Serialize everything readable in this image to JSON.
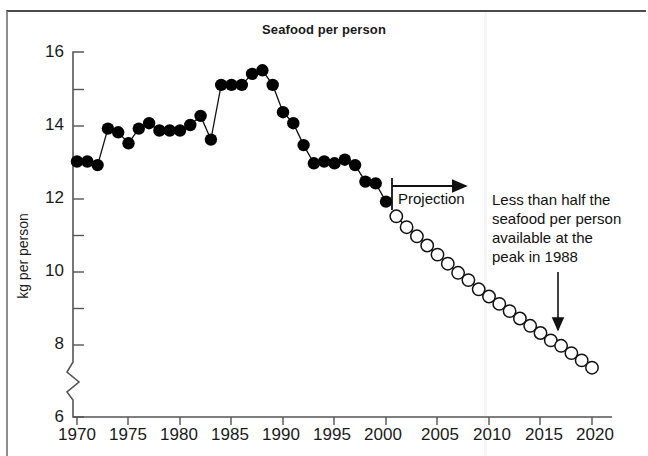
{
  "chart_data": {
    "type": "line",
    "title": "Seafood per person",
    "xlabel": "",
    "ylabel": "kg per person",
    "xlim": [
      1969,
      2021
    ],
    "ylim": [
      6,
      16
    ],
    "yaxis_break": true,
    "grid": false,
    "legend": null,
    "xticks": [
      "1970",
      "1975",
      "1980",
      "1985",
      "1990",
      "1995",
      "2000",
      "2005",
      "2010",
      "2015",
      "2020"
    ],
    "yticks": [
      "6",
      "8",
      "10",
      "12",
      "14",
      "16"
    ],
    "yminorticks": [
      7,
      9,
      11,
      13,
      15
    ],
    "series": [
      {
        "name": "Historical",
        "marker": "filled-circle",
        "color": "#000000",
        "x": [
          1970,
          1971,
          1972,
          1973,
          1974,
          1975,
          1976,
          1977,
          1978,
          1979,
          1980,
          1981,
          1982,
          1983,
          1984,
          1985,
          1986,
          1987,
          1988,
          1989,
          1990,
          1991,
          1992,
          1993,
          1994,
          1995,
          1996,
          1997,
          1998,
          1999,
          2000
        ],
        "values": [
          13.0,
          13.0,
          12.9,
          13.9,
          13.8,
          13.5,
          13.9,
          14.05,
          13.85,
          13.85,
          13.85,
          14.0,
          14.25,
          13.6,
          15.1,
          15.1,
          15.1,
          15.4,
          15.5,
          15.1,
          14.35,
          14.05,
          13.45,
          12.95,
          13.0,
          12.95,
          13.05,
          12.9,
          12.45,
          12.4,
          11.9
        ]
      },
      {
        "name": "Projection",
        "marker": "open-circle",
        "color": "#000000",
        "x": [
          2001,
          2002,
          2003,
          2004,
          2005,
          2006,
          2007,
          2008,
          2009,
          2010,
          2011,
          2012,
          2013,
          2014,
          2015,
          2016,
          2017,
          2018,
          2019,
          2020
        ],
        "values": [
          11.5,
          11.2,
          10.95,
          10.7,
          10.45,
          10.2,
          9.95,
          9.75,
          9.5,
          9.3,
          9.1,
          8.9,
          8.7,
          8.5,
          8.3,
          8.1,
          7.95,
          7.75,
          7.55,
          7.35
        ]
      }
    ],
    "annotations": [
      {
        "name": "projection-label",
        "text": "Projection",
        "x_start": 2000,
        "x_end": 2009,
        "style": "arrow-right-with-left-bar"
      },
      {
        "name": "peak-callout",
        "text": "Less than half the seafood per person available at the peak in 1988",
        "lines": [
          "Less than half the",
          "seafood per person",
          "available at the",
          "peak in 1988"
        ],
        "arrow_points_to_x": 2018,
        "style": "arrow-down"
      }
    ]
  },
  "figure": {
    "title": "Seafood per person",
    "ylabel": "kg per person",
    "ytick_labels": [
      "16",
      "14",
      "12",
      "10",
      "8",
      "6"
    ],
    "xtick_labels": [
      "1970",
      "1975",
      "1980",
      "1985",
      "1990",
      "1995",
      "2000",
      "2005",
      "2010",
      "2015",
      "2020"
    ],
    "projection_text": "Projection",
    "callout_lines": [
      "Less than half the",
      "seafood per person",
      "available at the",
      "peak in 1988"
    ],
    "colors": {
      "ink": "#000000",
      "axis": "#555555",
      "frame": "#8e8e8e",
      "background": "#ffffff"
    }
  }
}
